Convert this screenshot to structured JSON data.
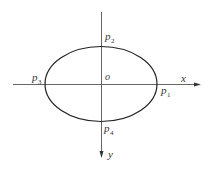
{
  "diagram": {
    "type": "ellipse-on-axes",
    "colors": {
      "axis": "#555555",
      "curve": "#222222",
      "text": "#333333"
    },
    "axes": {
      "x_label": "x",
      "y_label": "y",
      "origin_label": "o"
    },
    "points": [
      {
        "id": "p1",
        "base": "p",
        "sub": "1",
        "position": "right"
      },
      {
        "id": "p2",
        "base": "p",
        "sub": "2",
        "position": "top"
      },
      {
        "id": "p3",
        "base": "p",
        "sub": "3",
        "position": "left"
      },
      {
        "id": "p4",
        "base": "p",
        "sub": "4",
        "position": "bottom"
      }
    ]
  }
}
